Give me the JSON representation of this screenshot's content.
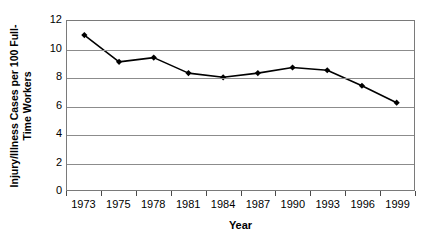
{
  "chart_data": {
    "type": "line",
    "title": "",
    "xlabel": "Year",
    "ylabel": "Injury/Illness Cases per 100 Full-Time Workers",
    "ylabel_lines": [
      "Injury/Illness Cases per 100 Full-",
      "Time Workers"
    ],
    "categories": [
      "1973",
      "1975",
      "1978",
      "1981",
      "1984",
      "1987",
      "1990",
      "1993",
      "1996",
      "1999"
    ],
    "values": [
      11.0,
      9.1,
      9.4,
      8.3,
      8.0,
      8.3,
      8.7,
      8.5,
      7.4,
      6.2
    ],
    "series": [
      {
        "name": "Injury/Illness Cases per 100 Full-Time Workers",
        "values": [
          11.0,
          9.1,
          9.4,
          8.3,
          8.0,
          8.3,
          8.7,
          8.5,
          7.4,
          6.2
        ]
      }
    ],
    "ylim": [
      0,
      12
    ],
    "yticks": [
      0,
      2,
      4,
      6,
      8,
      10,
      12
    ],
    "ytick_labels": [
      "0",
      "2",
      "4",
      "6",
      "8",
      "10",
      "12"
    ],
    "grid": true,
    "grid_axis": "y",
    "legend": false,
    "legend_position": "none",
    "marker": "diamond",
    "colors": {
      "line": "#000000",
      "marker": "#000000",
      "grid": "#8c8c8c",
      "axis": "#4a4a4a",
      "background": "#ffffff",
      "text": "#000000"
    }
  }
}
